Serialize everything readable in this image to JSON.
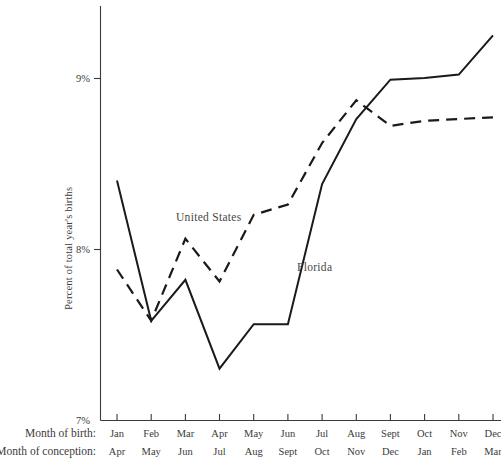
{
  "chart_data": {
    "type": "line",
    "title": "",
    "subtitle": "",
    "xlabel": "",
    "ylabel": "Percent of total year's births",
    "ylim": [
      7,
      9.4
    ],
    "yticks": [
      7,
      8,
      9
    ],
    "ytick_labels": [
      "7%",
      "8%",
      "9%"
    ],
    "grid": false,
    "legend_position": "inline-annotation",
    "categories": [
      "Jan",
      "Feb",
      "Mar",
      "Apr",
      "May",
      "Jun",
      "Jul",
      "Aug",
      "Sept",
      "Oct",
      "Nov",
      "Dec"
    ],
    "secondary_categories": [
      "Apr",
      "May",
      "Jun",
      "Jul",
      "Aug",
      "Sept",
      "Oct",
      "Nov",
      "Dec",
      "Jan",
      "Feb",
      "Mar"
    ],
    "axis_row_labels": {
      "primary": "Month of birth:",
      "secondary": "Month of conception:"
    },
    "series": [
      {
        "name": "United States",
        "style": "dashed",
        "values": [
          7.88,
          7.58,
          8.06,
          7.81,
          8.2,
          8.26,
          8.62,
          8.87,
          8.72,
          8.75,
          8.76,
          8.77
        ]
      },
      {
        "name": "Florida",
        "style": "solid",
        "values": [
          8.4,
          7.58,
          7.82,
          7.3,
          7.56,
          7.56,
          8.38,
          8.76,
          8.99,
          9.0,
          9.02,
          9.25
        ]
      }
    ],
    "annotations": [
      {
        "text": "United States",
        "x": 0.3,
        "y": 8.21
      },
      {
        "text": "Florida",
        "x": 0.55,
        "y": 7.87
      }
    ]
  },
  "axis": {
    "y_label": "Percent of total year's births",
    "y_tick_0": "7%",
    "y_tick_1": "8%",
    "y_tick_2": "9%",
    "row1_title": "Month of birth:",
    "row2_title": "Month of conception:",
    "birth_months": [
      "Jan",
      "Feb",
      "Mar",
      "Apr",
      "May",
      "Jun",
      "Jul",
      "Aug",
      "Sept",
      "Oct",
      "Nov",
      "Dec"
    ],
    "conception_months": [
      "Apr",
      "May",
      "Jun",
      "Jul",
      "Aug",
      "Sept",
      "Oct",
      "Nov",
      "Dec",
      "Jan",
      "Feb",
      "Mar"
    ]
  },
  "labels": {
    "united_states": "United States",
    "florida": "Florida"
  }
}
